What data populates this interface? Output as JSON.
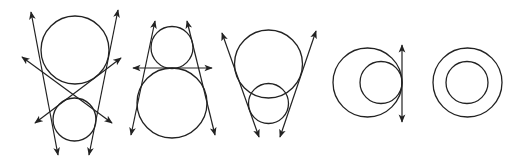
{
  "diagram": {
    "stroke": "#222222",
    "background": "#ffffff",
    "figures": [
      {
        "name": "separate-circles-four-tangents",
        "circles": [
          {
            "cx": 75,
            "cy": 50,
            "r": 34
          },
          {
            "cx": 74.5,
            "cy": 119.5,
            "r": 21.5
          }
        ],
        "lines": [
          {
            "x1": 31,
            "y1": 12,
            "x2": 58,
            "y2": 155
          },
          {
            "x1": 118,
            "y1": 10,
            "x2": 89,
            "y2": 155
          },
          {
            "x1": 22,
            "y1": 57,
            "x2": 112,
            "y2": 123
          },
          {
            "x1": 121,
            "y1": 58,
            "x2": 35,
            "y2": 123
          }
        ]
      },
      {
        "name": "externally-tangent-circles-three-tangents",
        "circles": [
          {
            "cx": 172,
            "cy": 47.5,
            "r": 21
          },
          {
            "cx": 172,
            "cy": 103,
            "r": 35
          }
        ],
        "lines": [
          {
            "x1": 155,
            "y1": 21,
            "x2": 131,
            "y2": 135
          },
          {
            "x1": 187,
            "y1": 21,
            "x2": 215,
            "y2": 135
          },
          {
            "x1": 133,
            "y1": 68,
            "x2": 212,
            "y2": 68
          }
        ]
      },
      {
        "name": "intersecting-circles-two-tangents",
        "circles": [
          {
            "cx": 268.5,
            "cy": 64,
            "r": 34
          },
          {
            "cx": 268.5,
            "cy": 103.5,
            "r": 20
          }
        ],
        "lines": [
          {
            "x1": 222,
            "y1": 33,
            "x2": 259,
            "y2": 137
          },
          {
            "x1": 316,
            "y1": 31,
            "x2": 280,
            "y2": 137
          }
        ]
      },
      {
        "name": "internally-tangent-circles-one-tangent",
        "circles": [
          {
            "cx": 367.5,
            "cy": 82.5,
            "r": 34.5
          },
          {
            "cx": 381,
            "cy": 82.5,
            "r": 21
          }
        ],
        "lines": [
          {
            "x1": 402,
            "y1": 45,
            "x2": 402,
            "y2": 122
          }
        ]
      },
      {
        "name": "concentric-circles-no-tangents",
        "circles": [
          {
            "cx": 467.5,
            "cy": 82.5,
            "r": 34.5
          },
          {
            "cx": 467,
            "cy": 82.5,
            "r": 21
          }
        ],
        "lines": []
      }
    ]
  }
}
